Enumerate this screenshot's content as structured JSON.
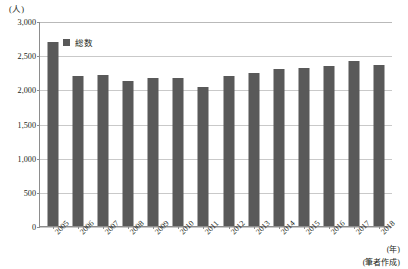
{
  "chart_data": {
    "type": "bar",
    "title": "",
    "subtitle": "",
    "xlabel": "(年)",
    "ylabel": "(人)",
    "ylim": [
      0,
      3000
    ],
    "ytick_labels": [
      "3,000",
      "2,500",
      "2,000",
      "1,500",
      "1,000",
      "500",
      "0"
    ],
    "ytick_values": [
      3000,
      2500,
      2000,
      1500,
      1000,
      500,
      0
    ],
    "grid": true,
    "legend_position": "top-left-inside",
    "legend": [
      "総数"
    ],
    "series": [
      {
        "name": "総数",
        "color": "#595959",
        "values": [
          2690,
          2200,
          2210,
          2125,
          2160,
          2160,
          2035,
          2195,
          2240,
          2300,
          2310,
          2345,
          2410,
          2355
        ]
      }
    ],
    "categories": [
      "2005",
      "2006",
      "2007",
      "2008",
      "2009",
      "2010",
      "2011",
      "2012",
      "2013",
      "2014",
      "2015",
      "2016",
      "2017",
      "2018"
    ],
    "annotations": [
      "(筆者作成)"
    ]
  },
  "axes": {
    "y_unit_label": "(人)",
    "x_unit_label": "(年)"
  },
  "legend": {
    "series_label": "総数"
  },
  "footer": {
    "source": "(筆者作成)"
  },
  "colors": {
    "bar": "#595959",
    "grid": "#c9c9c9",
    "axis": "#8d8d8d",
    "text": "#231f20"
  }
}
